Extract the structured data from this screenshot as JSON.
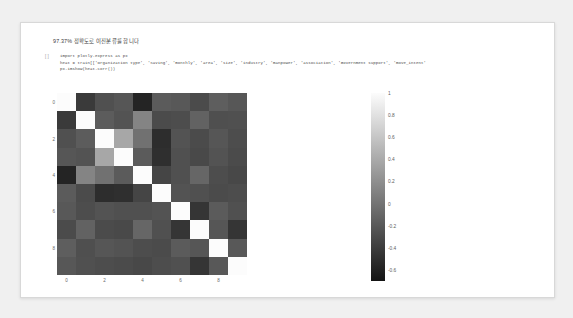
{
  "notebook": {
    "heading": "97.37% 정확도로 이진분류를 합니다",
    "cell_prompt": "[ ]",
    "code_lines": [
      "import plotly.express as px",
      "heat = train[['Organization type', 'Saving', 'monthly', 'area', 'size', 'industry', 'manpower', 'association', 'Government support', 'move_intent'",
      "px.imshow(heat.corr())"
    ]
  },
  "chart_data": {
    "type": "heatmap",
    "title": "",
    "xlabel": "",
    "ylabel": "",
    "colorscale": "gray",
    "zmin": -0.7,
    "zmax": 1.0,
    "xticks": [
      "0",
      "2",
      "4",
      "6",
      "8"
    ],
    "xtick_values": [
      0,
      2,
      4,
      6,
      8
    ],
    "yticks": [
      "0",
      "2",
      "4",
      "6",
      "8"
    ],
    "ytick_values": [
      0,
      2,
      4,
      6,
      8
    ],
    "colorbar": {
      "ticks": [
        "1",
        "0.8",
        "0.6",
        "0.4",
        "0.2",
        "0",
        "-0.2",
        "-0.4",
        "-0.6"
      ],
      "tick_values": [
        1,
        0.8,
        0.6,
        0.4,
        0.2,
        0,
        -0.2,
        -0.4,
        -0.6
      ],
      "position": "right"
    },
    "x": [
      0,
      1,
      2,
      3,
      4,
      5,
      6,
      7,
      8,
      9
    ],
    "y": [
      0,
      1,
      2,
      3,
      4,
      5,
      6,
      7,
      8,
      9
    ],
    "z": [
      [
        1.0,
        -0.42,
        -0.26,
        -0.22,
        -0.58,
        -0.18,
        -0.2,
        -0.3,
        -0.16,
        -0.21
      ],
      [
        -0.42,
        1.0,
        -0.17,
        -0.24,
        0.12,
        -0.3,
        -0.28,
        -0.13,
        -0.27,
        -0.26
      ],
      [
        -0.26,
        -0.17,
        1.0,
        0.38,
        -0.02,
        -0.52,
        -0.24,
        -0.3,
        -0.22,
        -0.28
      ],
      [
        -0.22,
        -0.24,
        0.38,
        1.0,
        -0.18,
        -0.5,
        -0.26,
        -0.31,
        -0.24,
        -0.3
      ],
      [
        -0.58,
        0.12,
        -0.02,
        -0.18,
        1.0,
        -0.34,
        -0.26,
        -0.1,
        -0.28,
        -0.32
      ],
      [
        -0.18,
        -0.3,
        -0.52,
        -0.5,
        -0.34,
        1.0,
        -0.24,
        -0.26,
        -0.3,
        -0.28
      ],
      [
        -0.2,
        -0.28,
        -0.24,
        -0.26,
        -0.26,
        -0.24,
        1.0,
        -0.46,
        -0.18,
        -0.26
      ],
      [
        -0.3,
        -0.13,
        -0.3,
        -0.31,
        -0.1,
        -0.26,
        -0.46,
        1.0,
        -0.22,
        -0.46
      ],
      [
        -0.16,
        -0.27,
        -0.22,
        -0.24,
        -0.28,
        -0.3,
        -0.18,
        -0.22,
        1.0,
        -0.2
      ],
      [
        -0.21,
        -0.26,
        -0.28,
        -0.3,
        -0.32,
        -0.28,
        -0.26,
        -0.46,
        -0.2,
        1.0
      ]
    ]
  }
}
